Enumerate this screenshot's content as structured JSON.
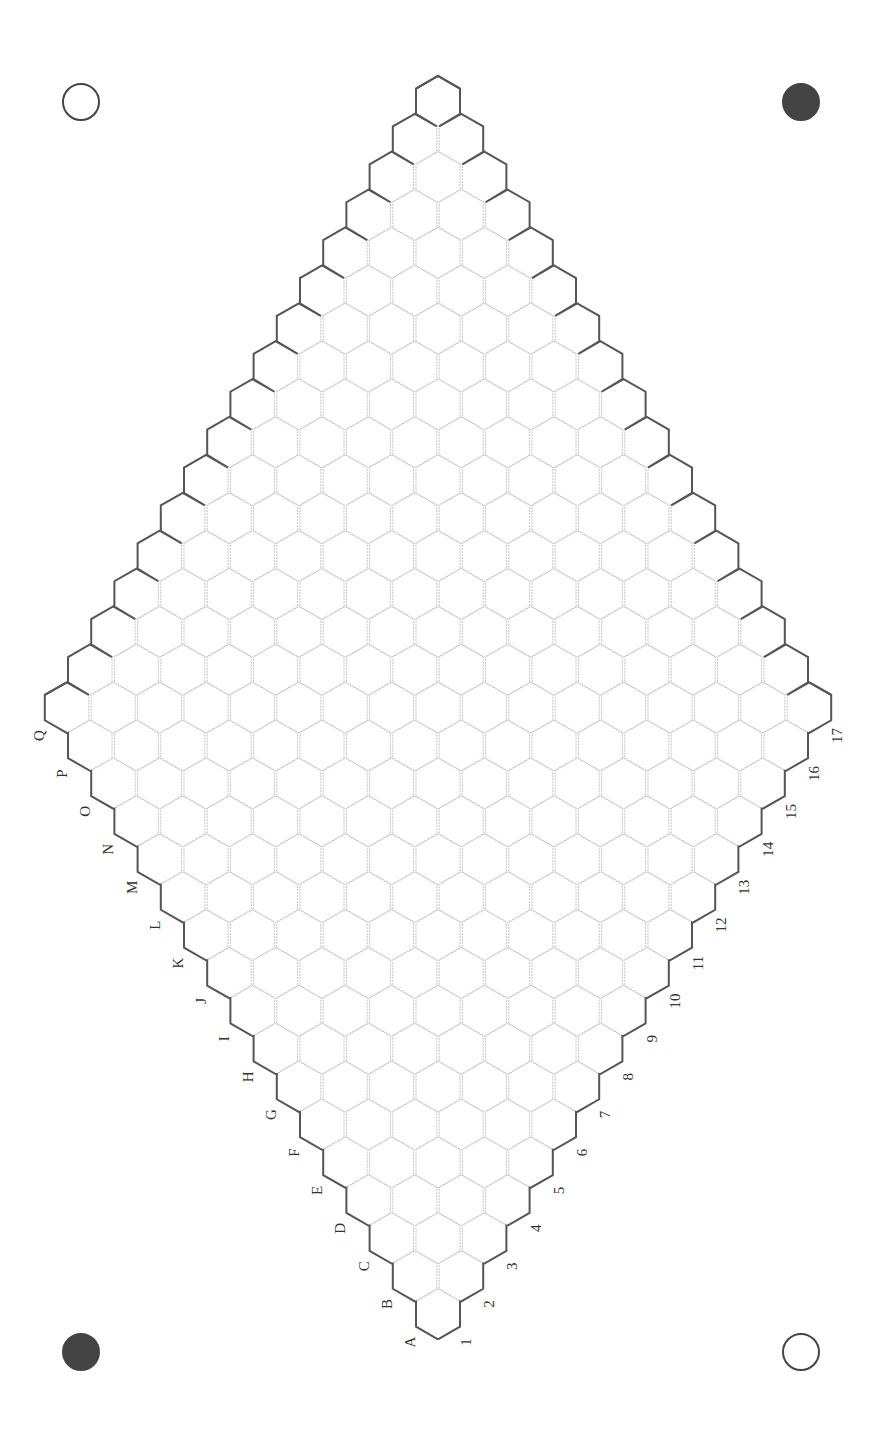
{
  "board": {
    "type": "Hex",
    "size": 17,
    "column_labels": [
      "A",
      "B",
      "C",
      "D",
      "E",
      "F",
      "G",
      "H",
      "I",
      "J",
      "K",
      "L",
      "M",
      "N",
      "O",
      "P",
      "Q"
    ],
    "row_labels": [
      "1",
      "2",
      "3",
      "4",
      "5",
      "6",
      "7",
      "8",
      "9",
      "10",
      "11",
      "12",
      "13",
      "14",
      "15",
      "16",
      "17"
    ],
    "stones": []
  },
  "corner_markers": [
    {
      "position": "top-left",
      "style": "open",
      "color": "#444444"
    },
    {
      "position": "top-right",
      "style": "filled",
      "color": "#444444"
    },
    {
      "position": "bottom-left",
      "style": "filled",
      "color": "#444444"
    },
    {
      "position": "bottom-right",
      "style": "open",
      "color": "#444444"
    }
  ],
  "colors": {
    "cell_line": "#c4c4c4",
    "border_line": "#555555",
    "label": "#333333",
    "background": "#ffffff"
  }
}
